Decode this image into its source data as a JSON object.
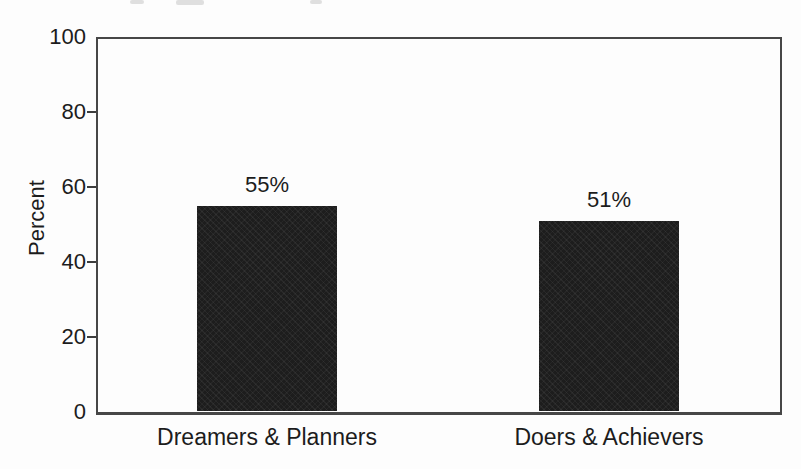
{
  "chart_data": {
    "type": "bar",
    "categories": [
      "Dreamers & Planners",
      "Doers & Achievers"
    ],
    "values": [
      55,
      51
    ],
    "value_labels": [
      "55%",
      "51%"
    ],
    "title": "",
    "xlabel": "",
    "ylabel": "Percent",
    "ylim": [
      0,
      100
    ],
    "yticks": [
      0,
      20,
      40,
      60,
      80,
      100
    ],
    "ytick_labels": [
      "0",
      "20",
      "40",
      "60",
      "80",
      "100"
    ],
    "legend": "none",
    "grid": "off",
    "bar_color": "#1d1d1d",
    "axis_color": "#474747",
    "text_color": "#1c1c1c",
    "background_color": "#fdfdfd"
  }
}
